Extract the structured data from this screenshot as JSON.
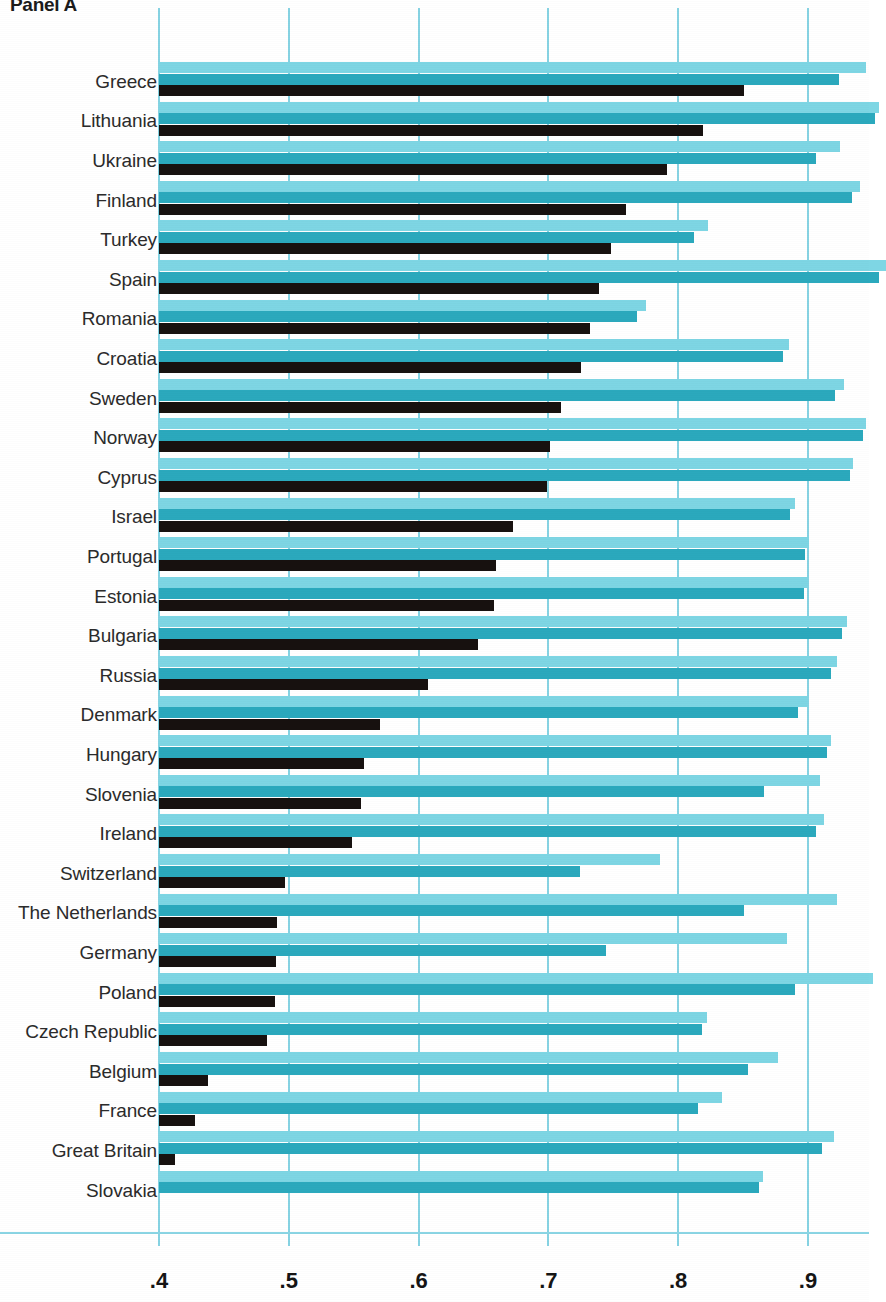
{
  "panel": {
    "title": "Panel A"
  },
  "axis": {
    "tick_labels": [
      ".4",
      ".5",
      ".6",
      ".7",
      ".8",
      ".9"
    ],
    "tick_values": [
      0.4,
      0.5,
      0.6,
      0.7,
      0.8,
      0.9
    ],
    "min": 0.4,
    "max": 0.9
  },
  "colors": {
    "light": "#7ed6e4",
    "teal": "#2ba9bd",
    "black": "#17110f",
    "grid": "#86d3e3",
    "label": "#2b2b2b"
  },
  "chart_data": {
    "type": "bar",
    "orientation": "horizontal",
    "title": "Panel A",
    "xlabel": "",
    "ylabel": "",
    "xlim": [
      0.4,
      0.9
    ],
    "grid": true,
    "legend": "none",
    "categories": [
      "Greece",
      "Lithuania",
      "Ukraine",
      "Finland",
      "Turkey",
      "Spain",
      "Romania",
      "Croatia",
      "Sweden",
      "Norway",
      "Cyprus",
      "Israel",
      "Portugal",
      "Estonia",
      "Bulgaria",
      "Russia",
      "Denmark",
      "Hungary",
      "Slovenia",
      "Ireland",
      "Switzerland",
      "The Netherlands",
      "Germany",
      "Poland",
      "Czech Republic",
      "Belgium",
      "France",
      "Great Britain",
      "Slovakia"
    ],
    "series": [
      {
        "name": "light",
        "values": [
          0.945,
          0.955,
          0.925,
          0.94,
          0.823,
          0.96,
          0.775,
          0.885,
          0.928,
          0.945,
          0.935,
          0.89,
          0.901,
          0.9,
          0.93,
          0.922,
          0.9,
          0.918,
          0.909,
          0.912,
          0.786,
          0.922,
          0.884,
          0.95,
          0.822,
          0.877,
          0.834,
          0.92,
          0.865
        ]
      },
      {
        "name": "teal",
        "values": [
          0.924,
          0.952,
          0.906,
          0.934,
          0.812,
          0.955,
          0.768,
          0.881,
          0.921,
          0.942,
          0.932,
          0.886,
          0.898,
          0.897,
          0.926,
          0.918,
          0.892,
          0.915,
          0.866,
          0.906,
          0.724,
          0.851,
          0.744,
          0.89,
          0.818,
          0.854,
          0.815,
          0.911,
          0.862
        ]
      },
      {
        "name": "black",
        "values": [
          0.851,
          0.819,
          0.791,
          0.76,
          0.748,
          0.739,
          0.732,
          0.725,
          0.71,
          0.701,
          0.699,
          0.673,
          0.66,
          0.658,
          0.646,
          0.607,
          0.57,
          0.558,
          0.556,
          0.549,
          0.497,
          0.491,
          0.49,
          0.489,
          0.483,
          0.438,
          0.428,
          0.412,
          null
        ]
      }
    ]
  }
}
